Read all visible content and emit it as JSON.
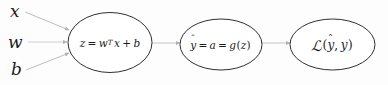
{
  "diagram": {
    "background_color": "#fdfdfd",
    "ellipse_stroke_color": "#2b2b2b",
    "edge_color": "#b9b9b9",
    "text_color": "#1b1b1b",
    "inputs": [
      {
        "label": "x",
        "name": "input-x"
      },
      {
        "label": "w",
        "name": "input-w"
      },
      {
        "label": "b",
        "name": "input-b"
      }
    ],
    "nodes": [
      {
        "name": "node-linear",
        "expression": "z = w^T x + b",
        "lhs": "z",
        "eq": "=",
        "w": "w",
        "sup": "T",
        "x": "x",
        "plus": "+",
        "b": "b"
      },
      {
        "name": "node-activation",
        "expression": "ŷ = a = g(z)",
        "yhat_base": "y",
        "hat": "ˆ",
        "eq1": "=",
        "a": "a",
        "eq2": "=",
        "g": "g",
        "lparen": "(",
        "z": "z",
        "rparen": ")"
      },
      {
        "name": "node-loss",
        "expression": "ℒ(ŷ, y)",
        "L": "ℒ",
        "lparen": "(",
        "yhat_base": "y",
        "hat": "ˆ",
        "comma": ",",
        "y": "y",
        "rparen": ")"
      }
    ],
    "edges": [
      {
        "name": "edge-x-to-linear",
        "from": "x",
        "to": "node-linear"
      },
      {
        "name": "edge-w-to-linear",
        "from": "w",
        "to": "node-linear"
      },
      {
        "name": "edge-b-to-linear",
        "from": "b",
        "to": "node-linear"
      },
      {
        "name": "edge-linear-to-activation",
        "from": "node-linear",
        "to": "node-activation"
      },
      {
        "name": "edge-activation-to-loss",
        "from": "node-activation",
        "to": "node-loss"
      }
    ]
  }
}
